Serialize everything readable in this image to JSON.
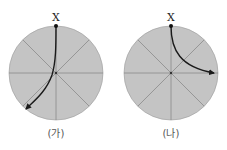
{
  "figure": {
    "panels": [
      {
        "id": "ga",
        "caption": "(가)",
        "point_label": "X",
        "fill_color": "#c4c4c4",
        "line_color": "#8a8a8a",
        "path_color": "#1a1a1a",
        "path_description": "Curve from X at the top toward the center, continuing to the lower-left, ending with an arrow"
      },
      {
        "id": "na",
        "caption": "(나)",
        "point_label": "X",
        "fill_color": "#c4c4c4",
        "line_color": "#8a8a8a",
        "path_color": "#1a1a1a",
        "path_description": "Curve from X at the top bending right toward the right edge, ending with an arrow"
      }
    ]
  }
}
